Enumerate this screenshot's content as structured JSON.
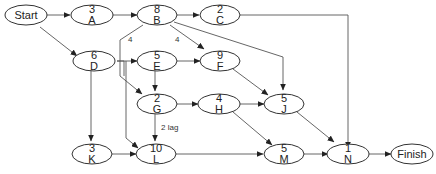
{
  "diagram": {
    "type": "activity-on-node network",
    "nodes": [
      {
        "id": "Start",
        "line1": "Start",
        "line2": ""
      },
      {
        "id": "A",
        "line1": "3",
        "line2": "A"
      },
      {
        "id": "B",
        "line1": "8",
        "line2": "B"
      },
      {
        "id": "C",
        "line1": "2",
        "line2": "C"
      },
      {
        "id": "D",
        "line1": "6",
        "line2": "D"
      },
      {
        "id": "E",
        "line1": "5",
        "line2": "E"
      },
      {
        "id": "F",
        "line1": "9",
        "line2": "F"
      },
      {
        "id": "G",
        "line1": "2",
        "line2": "G"
      },
      {
        "id": "H",
        "line1": "4",
        "line2": "H"
      },
      {
        "id": "J",
        "line1": "5",
        "line2": "J"
      },
      {
        "id": "K",
        "line1": "3",
        "line2": "K"
      },
      {
        "id": "L",
        "line1": "10",
        "line2": "L"
      },
      {
        "id": "M",
        "line1": "5",
        "line2": "M"
      },
      {
        "id": "N",
        "line1": "1",
        "line2": "N"
      },
      {
        "id": "Finish",
        "line1": "Finish",
        "line2": ""
      }
    ],
    "edges": [
      {
        "from": "Start",
        "to": "A"
      },
      {
        "from": "Start",
        "to": "D"
      },
      {
        "from": "A",
        "to": "B"
      },
      {
        "from": "B",
        "to": "C"
      },
      {
        "from": "B",
        "to": "F",
        "label": "4"
      },
      {
        "from": "B",
        "to": "J"
      },
      {
        "from": "B",
        "to": "G",
        "label": "4"
      },
      {
        "from": "C",
        "to": "N"
      },
      {
        "from": "D",
        "to": "E"
      },
      {
        "from": "D",
        "to": "G"
      },
      {
        "from": "D",
        "to": "L"
      },
      {
        "from": "D",
        "to": "K"
      },
      {
        "from": "E",
        "to": "F"
      },
      {
        "from": "E",
        "to": "G"
      },
      {
        "from": "F",
        "to": "J"
      },
      {
        "from": "G",
        "to": "H"
      },
      {
        "from": "G",
        "to": "L",
        "label": "2 lag"
      },
      {
        "from": "H",
        "to": "J"
      },
      {
        "from": "H",
        "to": "M"
      },
      {
        "from": "K",
        "to": "L"
      },
      {
        "from": "L",
        "to": "M"
      },
      {
        "from": "J",
        "to": "N"
      },
      {
        "from": "M",
        "to": "N"
      },
      {
        "from": "N",
        "to": "Finish"
      }
    ],
    "edge_labels": {
      "b_to_g": "4",
      "b_to_f": "4",
      "g_to_l": "2 lag"
    }
  }
}
